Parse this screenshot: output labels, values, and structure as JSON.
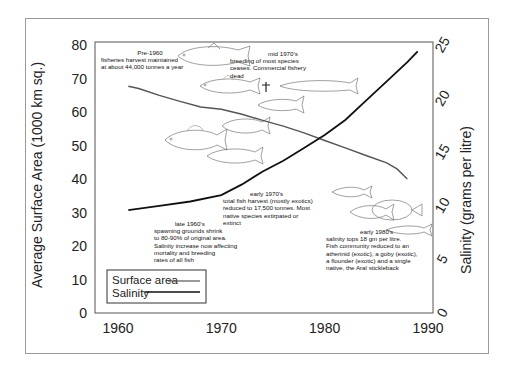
{
  "chart_data": {
    "type": "line",
    "title": "",
    "xlabel": "",
    "ylabel": "Average Surface Area (1000 km sq.)",
    "y2label": "Salinity (grams per litre)",
    "xlim": [
      1958,
      1990
    ],
    "ylim": [
      0,
      80
    ],
    "y2lim": [
      0,
      25
    ],
    "x_ticks": [
      "1960",
      "1970",
      "1980",
      "1990"
    ],
    "y_ticks": [
      "0",
      "10",
      "20",
      "30",
      "40",
      "50",
      "60",
      "70",
      "80"
    ],
    "y2_ticks": [
      "0",
      "5",
      "10",
      "15",
      "20",
      "25"
    ],
    "grid": false,
    "legend_position": "lower left",
    "series": [
      {
        "name": "Surface area",
        "axis": "left",
        "color": "#555555",
        "x": [
          1961,
          1962,
          1964,
          1966,
          1968,
          1970,
          1972,
          1974,
          1976,
          1978,
          1980,
          1982,
          1984,
          1986,
          1987,
          1988
        ],
        "values": [
          67.7,
          67.0,
          65.0,
          63.2,
          61.5,
          60.8,
          59.3,
          57.5,
          55.8,
          53.8,
          51.5,
          49.3,
          47.0,
          44.8,
          43.0,
          40.0
        ]
      },
      {
        "name": "Salinity",
        "axis": "right",
        "color": "#111111",
        "x": [
          1961,
          1964,
          1967,
          1970,
          1972,
          1974,
          1976,
          1978,
          1980,
          1982,
          1984,
          1986,
          1988,
          1989
        ],
        "values": [
          9.6,
          10.0,
          10.4,
          11.0,
          12.0,
          13.2,
          14.2,
          15.4,
          16.6,
          18.0,
          19.8,
          21.6,
          23.4,
          24.4
        ]
      }
    ],
    "annotations": [
      {
        "heading": "Pre-1960",
        "lines": [
          "fisheries harvest  maintained",
          "at about 44,000 tonnes a year"
        ]
      },
      {
        "heading": "mid 1970's",
        "lines": [
          "breeding of most species",
          "ceases. Commercial fishery",
          "dead"
        ]
      },
      {
        "heading": "late 1960's",
        "lines": [
          "spawning grounds shrink",
          "to 80-90% of original area.",
          "Salinity increase now affecting",
          "mortality and breeding",
          "rates of all fish"
        ]
      },
      {
        "heading": "early 1970's",
        "lines": [
          "total fish harvest (mostly exotics)",
          "reduced to 17,500 tonnes. Most",
          "native species extirpated or",
          "extinct"
        ]
      },
      {
        "heading": "early 1980's",
        "lines": [
          "salinity tops 18 gm per litre.",
          "Fish community reduced to  an",
          "atherinid (exotic), a goby (exotic),",
          "a flounder (exotic) and a single",
          "native, the Aral stickleback"
        ]
      }
    ]
  },
  "legend": {
    "surface_label": "Surface area",
    "salinity_label": "Salinity"
  },
  "icons": [
    "fish-illustration",
    "cross-icon"
  ]
}
